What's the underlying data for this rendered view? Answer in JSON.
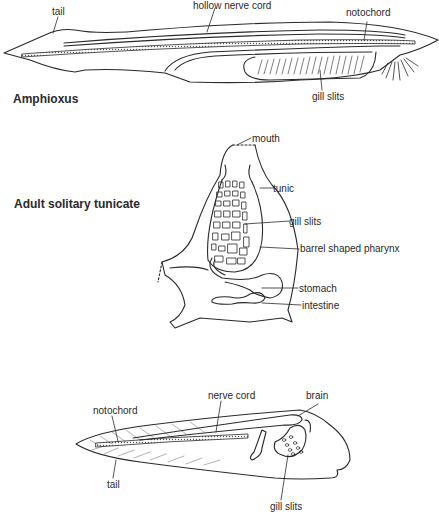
{
  "figures": [
    {
      "title": "Amphioxus",
      "labels": {
        "tail": "tail",
        "hollow_nerve_cord": "hollow nerve cord",
        "notochord": "notochord",
        "gill_slits": "gill slits"
      }
    },
    {
      "title": "Adult solitary tunicate",
      "labels": {
        "mouth": "mouth",
        "tunic": "tunic",
        "gill_slits": "gill slits",
        "pharynx": "barrel shaped pharynx",
        "stomach": "stomach",
        "intestine": "intestine"
      }
    },
    {
      "title": "",
      "labels": {
        "notochord": "notochord",
        "nerve_cord": "nerve cord",
        "brain": "brain",
        "tail": "tail",
        "gill_slits": "gill slits"
      }
    }
  ]
}
